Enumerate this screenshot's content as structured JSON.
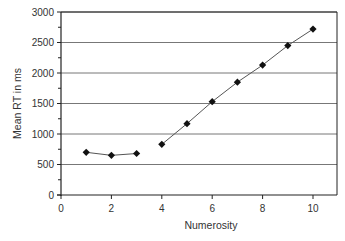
{
  "chart_data": {
    "type": "line",
    "title": "",
    "xlabel": "Numerosity",
    "ylabel": "Mean RT in ms",
    "xlim": [
      0,
      11
    ],
    "ylim": [
      0,
      3000
    ],
    "xticks": [
      0,
      2,
      4,
      6,
      8,
      10
    ],
    "yticks": [
      0,
      500,
      1000,
      1500,
      2000,
      2500,
      3000
    ],
    "grid": "horizontal",
    "legend": null,
    "series": [
      {
        "name": "Mean RT (subitizing range)",
        "marker": "diamond",
        "x": [
          1,
          2,
          3
        ],
        "values": [
          700,
          650,
          680
        ]
      },
      {
        "name": "Mean RT (counting range)",
        "marker": "diamond",
        "x": [
          4,
          5,
          6,
          7,
          8,
          9,
          10
        ],
        "values": [
          830,
          1170,
          1530,
          1850,
          2130,
          2450,
          2720
        ]
      }
    ],
    "colors": {
      "line": "#555555",
      "marker": "#111111",
      "grid": "#777777",
      "axis": "#222222"
    }
  }
}
